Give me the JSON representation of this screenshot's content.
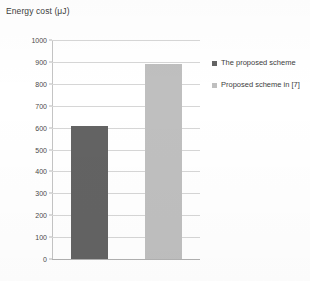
{
  "chart_data": {
    "type": "bar",
    "title": "Energy cost (μJ)",
    "xlabel": "",
    "ylabel": "",
    "ylim": [
      0,
      1000
    ],
    "y_ticks": [
      0,
      100,
      200,
      300,
      400,
      500,
      600,
      700,
      800,
      900,
      1000
    ],
    "grid": true,
    "legend_position": "right",
    "categories": [
      "The proposed scheme",
      "Proposed scheme in [7]"
    ],
    "values": [
      608,
      890
    ],
    "bars": [
      {
        "label": "The proposed scheme",
        "value": 608,
        "color": "#636363"
      },
      {
        "label": "Proposed scheme in [7]",
        "value": 890,
        "color": "#bfbfbf"
      }
    ],
    "legend": [
      {
        "label": "The proposed scheme",
        "color": "#636363"
      },
      {
        "label": "Proposed scheme in [7]",
        "color": "#bfbfbf"
      }
    ]
  },
  "colors": {
    "series_1": "#636363",
    "series_2": "#bfbfbf",
    "grid": "#d6d6d6",
    "axis": "#b0b0b0",
    "text": "#3d3d3d",
    "background": "#ffffff"
  }
}
